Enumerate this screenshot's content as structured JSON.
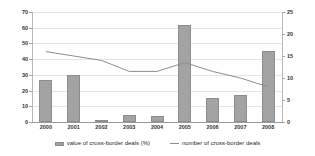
{
  "chart_data": {
    "type": "bar",
    "title": "",
    "xlabel": "",
    "categories": [
      "2000",
      "2001",
      "2002",
      "2003",
      "2004",
      "2005",
      "2006",
      "2007",
      "2008"
    ],
    "series": [
      {
        "name": "value of cross-border deals (%)",
        "type": "bar",
        "axis": "left",
        "color": "#a3a3a3",
        "values": [
          27,
          30,
          1,
          4.5,
          4,
          62,
          15,
          17,
          45
        ]
      },
      {
        "name": "number of cross-border deals",
        "type": "line",
        "axis": "right",
        "color": "#8d8d8d",
        "values": [
          16,
          15,
          14,
          11.5,
          11.5,
          13.5,
          11.5,
          10,
          8
        ]
      }
    ],
    "left_axis": {
      "label": "",
      "ylim": [
        0,
        70
      ],
      "ticks": [
        0,
        10,
        20,
        30,
        40,
        50,
        60,
        70
      ]
    },
    "right_axis": {
      "label": "",
      "ylim": [
        0,
        25
      ],
      "ticks": [
        0,
        5,
        10,
        15,
        20,
        25
      ]
    },
    "grid": true,
    "legend_position": "bottom"
  },
  "legend": {
    "items": [
      {
        "label": "value of cross-border deals (%)",
        "marker": "bar-swatch"
      },
      {
        "label": "number of cross-border deals",
        "marker": "line-swatch"
      }
    ]
  }
}
